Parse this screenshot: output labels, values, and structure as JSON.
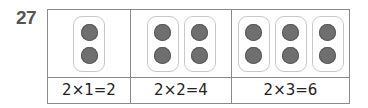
{
  "problem_number": "27",
  "columns": [
    {
      "groups": 2,
      "group_count": 1,
      "equation": "2×1=2"
    },
    {
      "groups": 2,
      "group_count": 2,
      "equation": "2×2=4"
    },
    {
      "groups": 2,
      "group_count": 3,
      "equation": "2×3=6"
    }
  ],
  "colors": {
    "dot": "#6f6f6f",
    "border": "#8a8a8a",
    "pill_border": "#c8c8c8"
  }
}
